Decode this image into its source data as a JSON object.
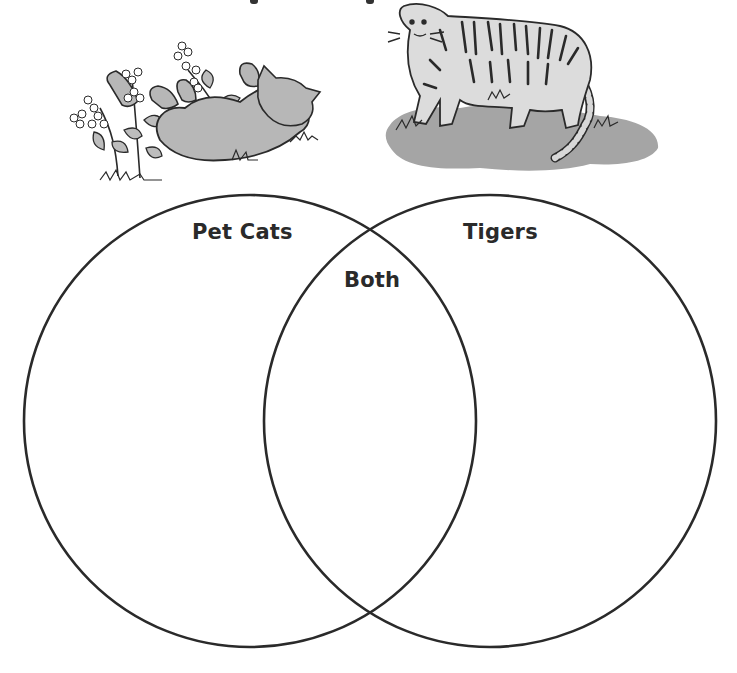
{
  "diagram": {
    "type": "venn",
    "sets": [
      {
        "id": "left",
        "label": "Pet Cats",
        "illustration": "cat-rolling-in-flowers-illustration"
      },
      {
        "id": "right",
        "label": "Tigers",
        "illustration": "tiger-standing-on-grass-illustration"
      }
    ],
    "intersection_label": "Both"
  },
  "colors": {
    "outline": "#2a2a2a",
    "fill_gray": "#a9a9a9",
    "body_gray": "#c8c8c8",
    "background": "#ffffff"
  }
}
